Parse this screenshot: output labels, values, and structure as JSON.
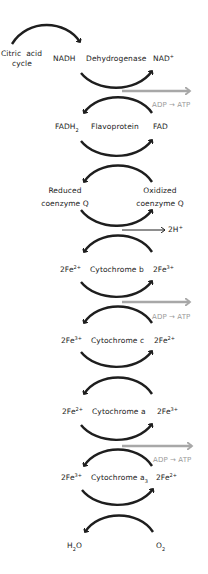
{
  "diagram": {
    "colors": {
      "arrow": "#1e1e1e",
      "atp_arrow": "#a8a8a8",
      "text": "#222222",
      "atp_text": "#9a9a9a"
    },
    "start": {
      "line1": "Citric",
      "line1b": "acid",
      "line2": "cycle"
    },
    "steps": [
      {
        "left": "NADH",
        "carrier": "Dehydrogenase",
        "right": "NAD",
        "right_sup": "+"
      },
      {
        "left": "FADH",
        "left_sub": "2",
        "carrier": "Flavoprotein",
        "right": "FAD"
      },
      {
        "left_line1": "Reduced",
        "left_line2": "coenzyme Q",
        "right_line1": "Oxidized",
        "right_line2": "coenzyme Q"
      },
      {
        "left": "2Fe",
        "left_sup": "2+",
        "carrier": "Cytochrome b",
        "right": "2Fe",
        "right_sup": "3+"
      },
      {
        "left": "2Fe",
        "left_sup": "3+",
        "carrier": "Cytochrome c",
        "right": "2Fe",
        "right_sup": "2+"
      },
      {
        "left": "2Fe",
        "left_sup": "2+",
        "carrier": "Cytochrome a",
        "right": "2Fe",
        "right_sup": "3+"
      },
      {
        "left": "2Fe",
        "left_sup": "3+",
        "carrier": "Cytochrome a",
        "carrier_sub": "3",
        "right": "2Fe",
        "right_sup": "2+"
      }
    ],
    "end": {
      "left": "H",
      "left_sub": "2",
      "left_tail": "O",
      "right": "O",
      "right_sub": "2"
    },
    "atp_labels": [
      "ADP → ATP",
      "ADP → ATP",
      "ADP → ATP"
    ],
    "proton_label": {
      "text": "2H",
      "sup": "+"
    }
  }
}
